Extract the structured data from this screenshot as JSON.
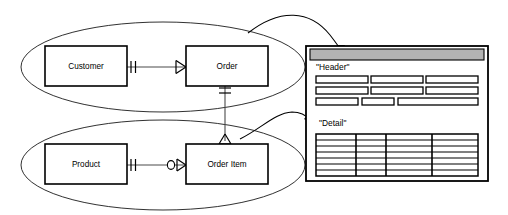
{
  "diagram": {
    "type": "entity-relationship-diagram",
    "notation": "crow-foot",
    "background_color": "#ffffff",
    "line_color": "#000000"
  },
  "groups": [
    {
      "id": "header-group",
      "name": "upper-entity-group",
      "maps_to": "Header"
    },
    {
      "id": "detail-group",
      "name": "lower-entity-group",
      "maps_to": "Detail"
    }
  ],
  "entities": [
    {
      "id": "customer",
      "label": "Customer",
      "group": "header-group"
    },
    {
      "id": "order",
      "label": "Order",
      "group": "header-group"
    },
    {
      "id": "product",
      "label": "Product",
      "group": "detail-group"
    },
    {
      "id": "order_item",
      "label": "Order Item",
      "group": "detail-group"
    }
  ],
  "relationships": [
    {
      "id": "customer-order",
      "from": "customer",
      "to": "order",
      "from_cardinality": "one-and-only-one",
      "to_cardinality": "one-or-many",
      "from_symbol": "||",
      "to_symbol": "crow-foot"
    },
    {
      "id": "product-orderitem",
      "from": "product",
      "to": "order_item",
      "from_cardinality": "one-and-only-one",
      "to_cardinality": "zero-or-many",
      "from_symbol": "||",
      "to_symbol": "circle-crow-foot"
    },
    {
      "id": "order-orderitem",
      "from": "order",
      "to": "order_item",
      "from_cardinality": "one-and-only-one",
      "to_cardinality": "one-or-many",
      "from_symbol": "||",
      "to_symbol": "crow-foot"
    }
  ],
  "mapping_arrows": [
    {
      "id": "arrow-header",
      "from": "header-group",
      "to": "panel-titlebar"
    },
    {
      "id": "arrow-detail",
      "from": "detail-group",
      "to": "detail-label"
    }
  ],
  "panel": {
    "titlebar_color": "#b3b3b3",
    "background_color": "#ffffff",
    "sections": [
      {
        "id": "header-section",
        "label": "\"Header\"",
        "field_rows": [
          [
            {
              "w": 52
            },
            {
              "w": 52
            },
            {
              "w": 52
            }
          ],
          [
            {
              "w": 52
            },
            {
              "w": 52
            },
            {
              "w": 52
            }
          ],
          [
            {
              "w": 42
            },
            {
              "w": 32
            },
            {
              "w": 72
            }
          ]
        ]
      },
      {
        "id": "detail-section",
        "label": "\"Detail\"",
        "grid": {
          "columns": 4,
          "rows": 7,
          "column_widths": [
            40,
            30,
            46,
            46
          ]
        }
      }
    ]
  }
}
